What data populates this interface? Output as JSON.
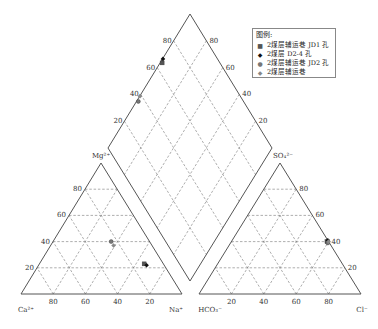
{
  "legend": {
    "title": "图例:",
    "items": [
      {
        "label": "2煤层辅运巷 JD1 孔",
        "marker": "■",
        "marker_name": "square-marker",
        "color": "#555555"
      },
      {
        "label": "2煤层 D2-4 孔",
        "marker": "◆",
        "marker_name": "diamond-marker",
        "color": "#111111"
      },
      {
        "label": "2煤层辅运巷 JD2 孔",
        "marker": "●",
        "marker_name": "circle-marker",
        "color": "#777777"
      },
      {
        "label": "2煤层辅运巷",
        "marker": "◆",
        "marker_name": "small-diamond-marker",
        "color": "#888888"
      }
    ]
  },
  "cation_triangle": {
    "apex_label": "Mg2+",
    "left_label": "Ca2+",
    "right_label": "Na+",
    "left_ticks": [
      "20",
      "40",
      "60",
      "80"
    ],
    "bottom_ticks": [
      "80",
      "60",
      "40",
      "20"
    ]
  },
  "anion_triangle": {
    "apex_label": "SO42-",
    "left_label": "HCO3-",
    "right_label": "Cl-",
    "right_ticks": [
      "20",
      "40",
      "60",
      "80"
    ],
    "bottom_ticks": [
      "20",
      "40",
      "60",
      "80"
    ]
  },
  "diamond": {
    "left_ticks": [
      "20",
      "40",
      "60",
      "80"
    ],
    "right_ticks": [
      "20",
      "40",
      "60",
      "80"
    ]
  },
  "chart_data": {
    "type": "scatter",
    "legend_position": "upper right",
    "grid": true,
    "cation_axes": [
      "Ca2+",
      "Mg2+",
      "Na+"
    ],
    "anion_axes": [
      "HCO3-",
      "SO42-",
      "Cl-"
    ],
    "series": [
      {
        "name": "2煤层辅运巷 JD1 孔",
        "cations": {
          "Ca": 12,
          "Mg": 23,
          "Na": 65
        },
        "anions": {
          "HCO3": 1,
          "SO4": 40,
          "Cl": 59
        }
      },
      {
        "name": "2煤层 D2-4 孔",
        "cations": {
          "Ca": 11,
          "Mg": 22,
          "Na": 67
        },
        "anions": {
          "HCO3": 0,
          "SO4": 41,
          "Cl": 59
        }
      },
      {
        "name": "2煤层辅运巷 JD2 孔",
        "cations": {
          "Ca": 24,
          "Mg": 40,
          "Na": 36
        },
        "anions": {
          "HCO3": 1,
          "SO4": 39,
          "Cl": 60
        }
      },
      {
        "name": "2煤层辅运巷",
        "cations": {
          "Ca": 24,
          "Mg": 37,
          "Na": 39
        },
        "anions": {
          "HCO3": 0,
          "SO4": 40,
          "Cl": 60
        }
      }
    ]
  }
}
